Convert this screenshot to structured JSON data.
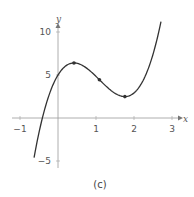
{
  "chart_data": {
    "type": "line",
    "title": "",
    "caption": "(c)",
    "xlabel": "x",
    "ylabel": "y",
    "xlim": [
      -1.2,
      3.3
    ],
    "ylim": [
      -6,
      11.5
    ],
    "x_ticks": [
      -1,
      1,
      2,
      3
    ],
    "x_tick_labels": [
      "−1",
      "1",
      "2",
      "3"
    ],
    "y_ticks": [
      -5,
      5,
      10
    ],
    "y_tick_labels": [
      "−5",
      "5",
      "10"
    ],
    "grid": false,
    "legend": null,
    "series": [
      {
        "name": "f(x)",
        "formula_approx": "3.26*(x^3 - 3.27x^2 + 2.22x) + 5",
        "x_range": [
          -0.63,
          2.71
        ],
        "color": "#333333",
        "points": [
          {
            "x": -0.63,
            "y": -3.4
          },
          {
            "x": -0.45,
            "y": 0
          },
          {
            "x": 0,
            "y": 5
          },
          {
            "x": 0.42,
            "y": 6.4
          },
          {
            "x": 1.09,
            "y": 4.5
          },
          {
            "x": 1.76,
            "y": 2.5
          },
          {
            "x": 2.71,
            "y": 10.8
          }
        ]
      }
    ],
    "marked_points": [
      {
        "label": "local-max",
        "x": 0.42,
        "y": 6.4
      },
      {
        "label": "inflection",
        "x": 1.09,
        "y": 4.5
      },
      {
        "label": "local-min",
        "x": 1.76,
        "y": 2.5
      }
    ]
  }
}
